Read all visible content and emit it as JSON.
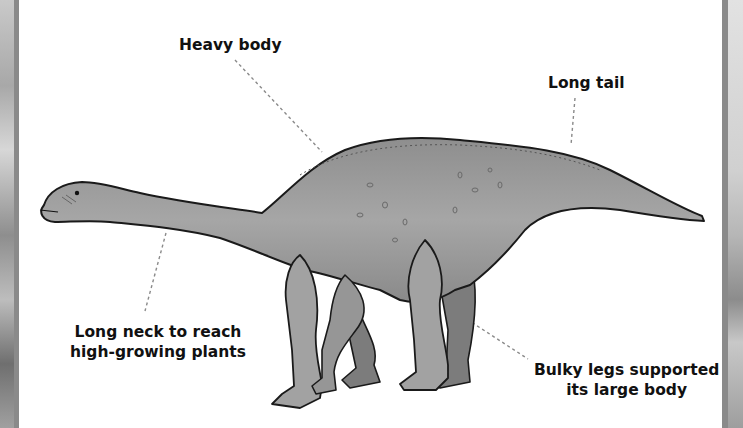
{
  "figure": {
    "colors": {
      "background": "#ffffff",
      "body_fill": "#9a9a9a",
      "outline": "#1a1a1a",
      "leader_line": "#8a8a8a",
      "label_text": "#111111"
    }
  },
  "labels": {
    "heavy_body": "Heavy body",
    "long_tail": "Long tail",
    "long_neck_line1": "Long neck to reach",
    "long_neck_line2": "high-growing plants",
    "bulky_legs_line1": "Bulky legs supported",
    "bulky_legs_line2": "its large body"
  }
}
